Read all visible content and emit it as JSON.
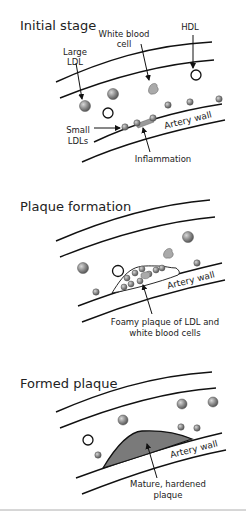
{
  "panels": [
    {
      "title": "Initial stage",
      "labels": {
        "large_ldl_1": "Large",
        "large_ldl_2": "LDL",
        "wbc_1": "White blood",
        "wbc_2": "cell",
        "hdl": "HDL",
        "small_ldls_1": "Small",
        "small_ldls_2": "LDLs",
        "artery_wall": "Artery wall",
        "inflammation": "Inflammation"
      }
    },
    {
      "title": "Plaque formation",
      "labels": {
        "artery_wall": "Artery wall",
        "foamy_1": "Foamy plaque of LDL and",
        "foamy_2": "white blood cells"
      }
    },
    {
      "title": "Formed plaque",
      "labels": {
        "artery_wall": "Artery wall",
        "mature_1": "Mature, hardened",
        "mature_2": "plaque"
      }
    }
  ],
  "colors": {
    "line": "#111111",
    "particle": "#8a8a8a",
    "plaque_fill": "#7a7a7a",
    "background": "#ffffff"
  }
}
